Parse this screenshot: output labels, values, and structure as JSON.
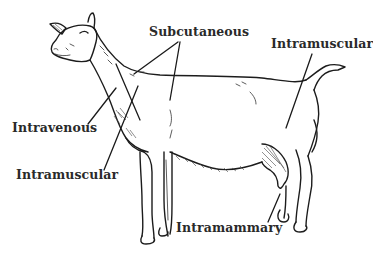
{
  "figure": {
    "labels": {
      "subcutaneous": "Subcutaneous",
      "intramuscular_hind": "Intramuscular",
      "intravenous": "Intravenous",
      "intramuscular_neck": "Intramuscular",
      "intramammary": "Intramammary"
    },
    "colors": {
      "background": "#ffffff",
      "ink": "#1c1c1c",
      "label_text": "#2a2a2a"
    }
  }
}
